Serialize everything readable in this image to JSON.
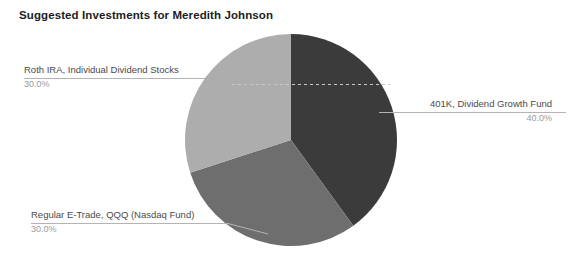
{
  "chart_data": {
    "type": "pie",
    "title": "Suggested Investments for Meredith Johnson",
    "xlabel": "",
    "ylabel": "",
    "legend": "none",
    "grid": false,
    "start_angle_deg": 0,
    "direction": "clockwise",
    "categories": [
      "401K, Dividend Growth Fund",
      "Regular E-Trade, QQQ (Nasdaq Fund)",
      "Roth IRA, Individual Dividend Stocks"
    ],
    "values": [
      40.0,
      30.0,
      30.0
    ],
    "value_labels": [
      "40.0%",
      "30.0%",
      "30.0%"
    ],
    "colors": [
      "#3b3b3b",
      "#6e6e6e",
      "#adadad"
    ],
    "slices": [
      {
        "label": "401K, Dividend Growth Fund",
        "value": 40.0,
        "value_label": "40.0%",
        "color": "#3b3b3b",
        "start_deg": 0,
        "end_deg": 144
      },
      {
        "label": "Regular E-Trade, QQQ (Nasdaq Fund)",
        "value": 30.0,
        "value_label": "30.0%",
        "color": "#6e6e6e",
        "start_deg": 144,
        "end_deg": 252
      },
      {
        "label": "Roth IRA, Individual Dividend Stocks",
        "value": 30.0,
        "value_label": "30.0%",
        "color": "#adadad",
        "start_deg": 252,
        "end_deg": 360
      }
    ]
  },
  "title": "Suggested Investments for Meredith Johnson",
  "callouts": {
    "roth_ira": {
      "label": "Roth IRA, Individual Dividend Stocks",
      "value": "30.0%"
    },
    "fourohonek": {
      "label": "401K, Dividend Growth Fund",
      "value": "40.0%"
    },
    "etrade": {
      "label": "Regular E-Trade, QQQ (Nasdaq Fund)",
      "value": "30.0%"
    }
  },
  "style": {
    "background": "#ffffff",
    "title_color": "#1c1c1c",
    "label_color": "#4a4a4a",
    "value_color": "#9a9a9a",
    "leader_color": "#b4b4b4",
    "dash_color": "#c8c8c8"
  }
}
